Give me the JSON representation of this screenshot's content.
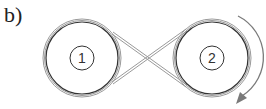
{
  "figure": {
    "label": "b)",
    "type": "crossed belt drive",
    "pulleys": [
      {
        "id": "1",
        "label": "1",
        "cx": 82,
        "cy": 58,
        "r": 36
      },
      {
        "id": "2",
        "label": "2",
        "cx": 212,
        "cy": 58,
        "r": 36
      }
    ],
    "rotation_arrow": {
      "pulley": "2",
      "direction": "clockwise"
    },
    "colors": {
      "pulley_stroke": "#333333",
      "belt_stroke": "#999999",
      "arrow": "#777777"
    }
  }
}
